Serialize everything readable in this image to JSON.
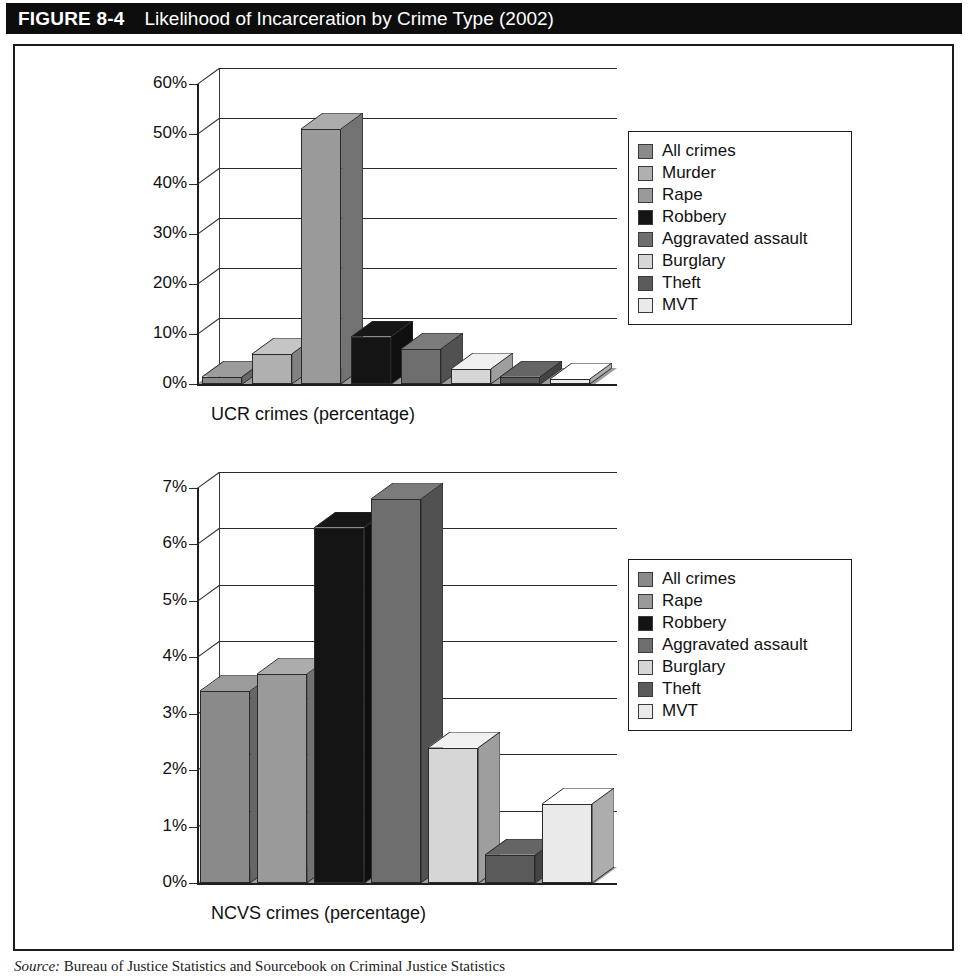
{
  "header": {
    "figure_number": "FIGURE 8-4",
    "title": "Likelihood of Incarceration by Crime Type (2002)"
  },
  "source": {
    "prefix": "Source:",
    "text": " Bureau of Justice Statistics and Sourcebook on Criminal Justice Statistics"
  },
  "colors": {
    "header_background": "#0d0d0d",
    "header_text": "#ffffff",
    "panel_border": "#1b1b1b",
    "page_background": "#ffffff",
    "axis": "#2b2b2b",
    "all_crimes": "#8a8a8a",
    "murder": "#b0b0b0",
    "rape": "#9a9a9a",
    "robbery": "#141414",
    "aggravated_assault": "#6e6e6e",
    "burglary": "#d6d6d6",
    "theft": "#5a5a5a",
    "mvt": "#eaeaea"
  },
  "chart_data": [
    {
      "type": "bar",
      "id": "ucr",
      "title": "",
      "xlabel": "UCR crimes (percentage)",
      "ylabel": "",
      "ylim": [
        0,
        60
      ],
      "ytick_labels": [
        "60%",
        "50%",
        "40%",
        "30%",
        "20%",
        "10%",
        "0%"
      ],
      "yticks": [
        60,
        50,
        40,
        30,
        20,
        10,
        0
      ],
      "grid": true,
      "legend_position": "right",
      "categories": [
        "All crimes",
        "Murder",
        "Rape",
        "Robbery",
        "Aggravated assault",
        "Burglary",
        "Theft",
        "MVT"
      ],
      "values": [
        1.5,
        6,
        51,
        9.5,
        7,
        3,
        1.5,
        1
      ],
      "bar_colors": [
        "#8a8a8a",
        "#b0b0b0",
        "#9a9a9a",
        "#141414",
        "#6e6e6e",
        "#d6d6d6",
        "#5a5a5a",
        "#eaeaea"
      ]
    },
    {
      "type": "bar",
      "id": "ncvs",
      "title": "",
      "xlabel": "NCVS crimes (percentage)",
      "ylabel": "",
      "ylim": [
        0,
        7
      ],
      "ytick_labels": [
        "7%",
        "6%",
        "5%",
        "4%",
        "3%",
        "2%",
        "1%",
        "0%"
      ],
      "yticks": [
        7,
        6,
        5,
        4,
        3,
        2,
        1,
        0
      ],
      "grid": true,
      "legend_position": "right",
      "categories": [
        "All crimes",
        "Rape",
        "Robbery",
        "Aggravated assault",
        "Burglary",
        "Theft",
        "MVT"
      ],
      "values": [
        3.4,
        3.7,
        6.3,
        6.8,
        2.4,
        0.5,
        1.4
      ],
      "bar_colors": [
        "#8a8a8a",
        "#9a9a9a",
        "#141414",
        "#6e6e6e",
        "#d6d6d6",
        "#5a5a5a",
        "#eaeaea"
      ]
    }
  ],
  "legends": {
    "ucr": [
      {
        "label": "All crimes",
        "color": "#8a8a8a"
      },
      {
        "label": "Murder",
        "color": "#b0b0b0"
      },
      {
        "label": "Rape",
        "color": "#9a9a9a"
      },
      {
        "label": "Robbery",
        "color": "#141414"
      },
      {
        "label": "Aggravated assault",
        "color": "#6e6e6e"
      },
      {
        "label": "Burglary",
        "color": "#d6d6d6"
      },
      {
        "label": "Theft",
        "color": "#5a5a5a"
      },
      {
        "label": "MVT",
        "color": "#eaeaea"
      }
    ],
    "ncvs": [
      {
        "label": "All crimes",
        "color": "#8a8a8a"
      },
      {
        "label": "Rape",
        "color": "#9a9a9a"
      },
      {
        "label": "Robbery",
        "color": "#141414"
      },
      {
        "label": "Aggravated assault",
        "color": "#6e6e6e"
      },
      {
        "label": "Burglary",
        "color": "#d6d6d6"
      },
      {
        "label": "Theft",
        "color": "#5a5a5a"
      },
      {
        "label": "MVT",
        "color": "#eaeaea"
      }
    ]
  }
}
